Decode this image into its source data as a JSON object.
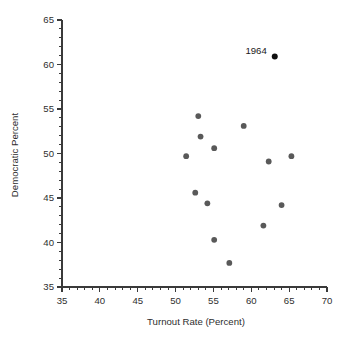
{
  "chart_data": {
    "type": "scatter",
    "title": "",
    "xlabel": "Turnout Rate (Percent)",
    "ylabel": "Democratic Percent",
    "xlim": [
      35,
      70
    ],
    "ylim": [
      35,
      65
    ],
    "xticks": [
      35,
      40,
      45,
      50,
      55,
      60,
      65,
      70
    ],
    "xtick_labels": [
      "35",
      "40",
      "45",
      "50",
      "55",
      "60",
      "65",
      "70"
    ],
    "yticks": [
      35,
      40,
      45,
      50,
      55,
      60,
      65
    ],
    "ytick_labels": [
      "35",
      "40",
      "45",
      "50",
      "55",
      "60",
      "65"
    ],
    "minor_tick_interval": 1,
    "grid": false,
    "legend": false,
    "marker_color": "#595959",
    "highlight_color": "#101010",
    "axis_color": "#3a3a3a",
    "background_color": "#ffffff",
    "points": [
      {
        "x": 51.4,
        "y": 49.7,
        "label": "",
        "highlight": false
      },
      {
        "x": 52.6,
        "y": 45.6,
        "label": "",
        "highlight": false
      },
      {
        "x": 53.0,
        "y": 54.2,
        "label": "",
        "highlight": false
      },
      {
        "x": 53.3,
        "y": 51.9,
        "label": "",
        "highlight": false
      },
      {
        "x": 54.2,
        "y": 44.4,
        "label": "",
        "highlight": false
      },
      {
        "x": 55.1,
        "y": 50.6,
        "label": "",
        "highlight": false
      },
      {
        "x": 55.1,
        "y": 40.3,
        "label": "",
        "highlight": false
      },
      {
        "x": 57.1,
        "y": 37.7,
        "label": "",
        "highlight": false
      },
      {
        "x": 59.0,
        "y": 53.1,
        "label": "",
        "highlight": false
      },
      {
        "x": 61.6,
        "y": 41.9,
        "label": "",
        "highlight": false
      },
      {
        "x": 62.3,
        "y": 49.1,
        "label": "",
        "highlight": false
      },
      {
        "x": 63.1,
        "y": 60.9,
        "label": "1964",
        "highlight": true
      },
      {
        "x": 64.0,
        "y": 44.2,
        "label": "",
        "highlight": false
      },
      {
        "x": 65.3,
        "y": 49.7,
        "label": "",
        "highlight": false
      }
    ],
    "annotations": [
      {
        "text": "1964",
        "x": 63.1,
        "y": 60.9
      }
    ]
  }
}
